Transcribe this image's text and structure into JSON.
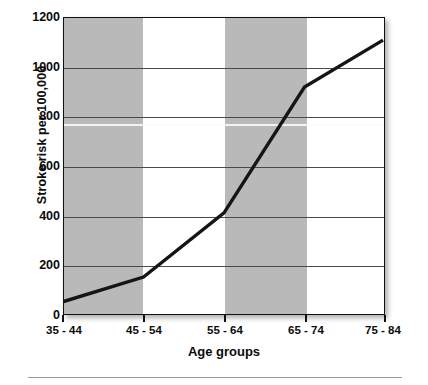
{
  "chart_data": {
    "type": "line",
    "title": "",
    "xlabel": "Age groups",
    "ylabel": "Stroke risk per 100,000",
    "categories": [
      "35 - 44",
      "45 - 54",
      "55 - 64",
      "65 - 74",
      "75 - 84"
    ],
    "values": [
      50,
      150,
      410,
      920,
      1110
    ],
    "series": [
      {
        "name": "Stroke risk",
        "values": [
          50,
          150,
          410,
          920,
          1110
        ]
      }
    ],
    "ylim": [
      0,
      1200
    ],
    "yticks": [
      0,
      200,
      400,
      600,
      800,
      1000,
      1200
    ],
    "ytick_labels": [
      "0",
      "200",
      "400",
      "600",
      "800",
      "1000",
      "1200"
    ],
    "xtick_labels": [
      "35 - 44",
      "45 - 54",
      "55 - 64",
      "65 - 74",
      "75 - 84"
    ],
    "grid": true,
    "legend": "none",
    "banding": {
      "description": "alternating vertical shaded bands behind plot",
      "shaded_categories": [
        "35 - 44",
        "55 - 64"
      ],
      "band_color": "#b9b9b9"
    },
    "colors": {
      "line": "#151515",
      "band": "#b9b9b9",
      "grid": "#4a4a4a",
      "frame": "#111111",
      "background": "#ffffff",
      "text": "#0b0b0b"
    }
  }
}
